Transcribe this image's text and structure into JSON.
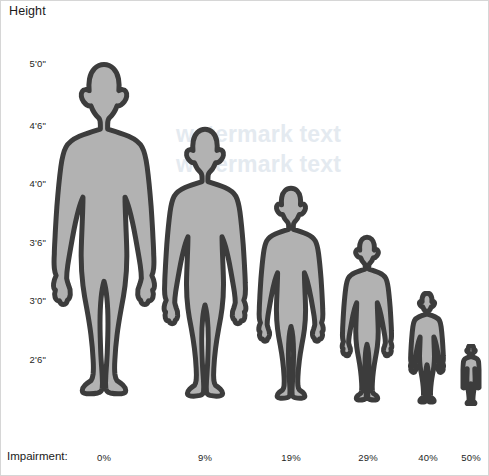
{
  "chart_data": {
    "type": "bar",
    "title": "Height",
    "xlabel": "Impairment:",
    "ylabel": "Height",
    "grid": false,
    "legend": "none",
    "categories": [
      "0%",
      "9%",
      "19%",
      "29%",
      "40%",
      "50%"
    ],
    "series": [
      {
        "name": "Height",
        "values": [
          "5'0\"",
          "4'6\"",
          "4'0\"",
          "3'6\"",
          "3'0\"",
          "2'6\""
        ],
        "values_inches": [
          60,
          53.3,
          47.2,
          42.1,
          36.3,
          31.9
        ]
      }
    ],
    "y_tick_labels": [
      "5'0\"",
      "4'6\"",
      "4'0\"",
      "3'6\"",
      "3'0\"",
      "2'6\""
    ],
    "y_tick_inches": [
      60,
      54,
      48,
      42,
      36,
      30
    ],
    "ylim_inches": [
      24,
      62
    ],
    "marker_style": "human-silhouette",
    "annotations": []
  },
  "title": {
    "text": "Height"
  },
  "y_axis": {
    "ticks": [
      {
        "label": "5'0\"",
        "y": 62
      },
      {
        "label": "4'6\"",
        "y": 124
      },
      {
        "label": "4'0\"",
        "y": 182
      },
      {
        "label": "3'6\"",
        "y": 241
      },
      {
        "label": "3'0\"",
        "y": 299
      },
      {
        "label": "2'6\"",
        "y": 358
      }
    ]
  },
  "x_axis": {
    "title": "Impairment:",
    "ticks": [
      {
        "label": "0%",
        "x": 103
      },
      {
        "label": "9%",
        "x": 204
      },
      {
        "label": "19%",
        "x": 290
      },
      {
        "label": "29%",
        "x": 367
      },
      {
        "label": "40%",
        "x": 427
      },
      {
        "label": "50%",
        "x": 470
      }
    ]
  },
  "figures": [
    {
      "name": "figure-0-percent",
      "impairment": "0%",
      "height": "5'0\"",
      "cx": 103,
      "w": 116,
      "h": 348
    },
    {
      "name": "figure-9-percent",
      "impairment": "9%",
      "height": "4'6\"",
      "cx": 204,
      "w": 94,
      "h": 282
    },
    {
      "name": "figure-19-percent",
      "impairment": "19%",
      "height": "4'0\"",
      "cx": 290,
      "w": 74,
      "h": 222
    },
    {
      "name": "figure-29-percent",
      "impairment": "29%",
      "height": "3'6\"",
      "cx": 366,
      "w": 57,
      "h": 172
    },
    {
      "name": "figure-40-percent",
      "impairment": "40%",
      "height": "3'0\"",
      "cx": 426,
      "w": 38,
      "h": 115
    },
    {
      "name": "figure-50-percent",
      "impairment": "50%",
      "height": "2'6\"",
      "cx": 470,
      "w": 21,
      "h": 62
    }
  ],
  "watermark": {
    "line1": "watermark text",
    "line2": "watermark text"
  },
  "colors": {
    "figure_fill": "#b2b2b2",
    "figure_outline": "#3c3c3c",
    "text": "#1a1a1a",
    "background": "#ffffff",
    "watermark": "#e4eaf0"
  }
}
